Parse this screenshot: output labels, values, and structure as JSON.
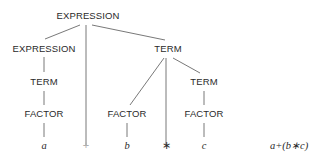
{
  "diagram": {
    "type": "parse-tree",
    "nodes": {
      "root": "EXPRESSION",
      "left_expression": "EXPRESSION",
      "left_term": "TERM",
      "left_factor": "FACTOR",
      "leaf_a": "a",
      "plus": "+",
      "right_term": "TERM",
      "mid_factor": "FACTOR",
      "leaf_b": "b",
      "times": "∗",
      "inner_term": "TERM",
      "inner_factor": "FACTOR",
      "leaf_c": "c"
    },
    "caption": "a+(b∗c)",
    "colors": {
      "text": "#2a2a2a",
      "lines": "#555555",
      "plus_faint": "#b0b0b0",
      "background": "#ffffff"
    }
  }
}
